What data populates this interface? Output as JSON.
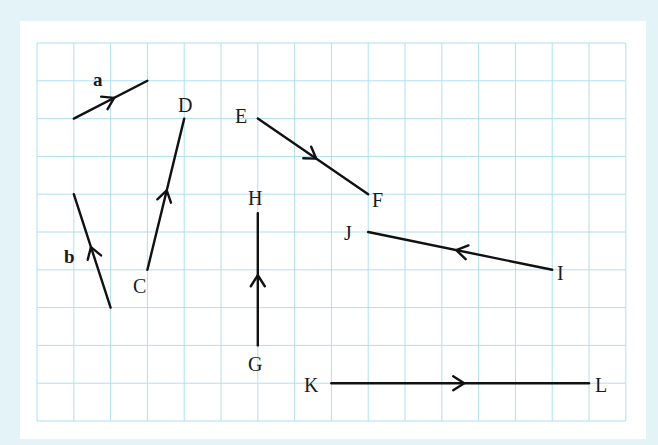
{
  "grid": {
    "columns": 16,
    "rows": 10,
    "line_color": "#aee0ee",
    "background": "#ffffff",
    "page_background": "#e4f3f8"
  },
  "vectors": [
    {
      "name": "a",
      "from": [
        1,
        2
      ],
      "to": [
        3,
        1
      ],
      "label": "a",
      "label_style": "bold",
      "arrow_direction": "toward end"
    },
    {
      "name": "b",
      "from": [
        2,
        7
      ],
      "to": [
        1,
        4
      ],
      "label": "b",
      "label_style": "bold",
      "arrow_direction": "upward"
    },
    {
      "name": "CD",
      "from_label": "C",
      "to_label": "D",
      "from": [
        3,
        6
      ],
      "to": [
        4,
        2
      ]
    },
    {
      "name": "EF",
      "from_label": "E",
      "to_label": "F",
      "from": [
        6,
        2
      ],
      "to": [
        9,
        4
      ]
    },
    {
      "name": "GH",
      "from_label": "G",
      "to_label": "H",
      "from": [
        6,
        8
      ],
      "to": [
        6,
        4.5
      ]
    },
    {
      "name": "IJ",
      "from_label": "I",
      "to_label": "J",
      "from": [
        14,
        6
      ],
      "to": [
        9,
        5
      ]
    },
    {
      "name": "KL",
      "from_label": "K",
      "to_label": "L",
      "from": [
        8,
        9
      ],
      "to": [
        15,
        9
      ]
    }
  ],
  "labels": {
    "a": "a",
    "b": "b",
    "C": "C",
    "D": "D",
    "E": "E",
    "F": "F",
    "G": "G",
    "H": "H",
    "I": "I",
    "J": "J",
    "K": "K",
    "L": "L"
  }
}
